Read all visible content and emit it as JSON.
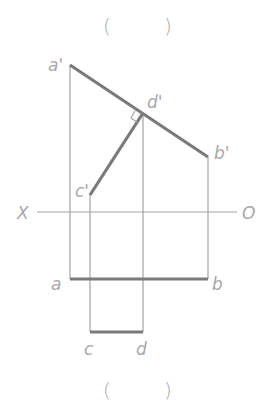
{
  "figure": {
    "top_caption": {
      "open": "(",
      "close": ")"
    },
    "bottom_caption": {
      "open": "(",
      "close": ")"
    },
    "axis": {
      "left_label": "X",
      "right_label": "O"
    },
    "labels": {
      "a_prime": "a'",
      "b_prime": "b'",
      "c_prime": "c'",
      "d_prime": "d'",
      "a": "a",
      "b": "b",
      "c": "c",
      "d": "d"
    },
    "colors": {
      "thick_line": "#7a7a7a",
      "thin_line": "#a3a3a3",
      "label": "#a8a8a8"
    }
  }
}
